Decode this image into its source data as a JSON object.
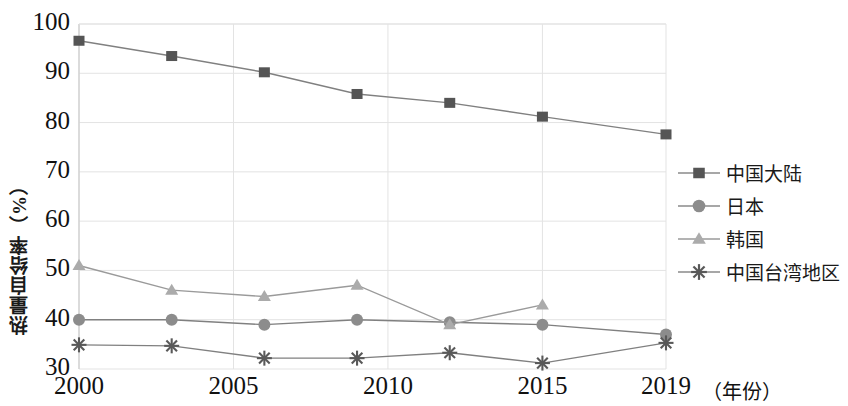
{
  "chart_data": {
    "type": "line",
    "title": "",
    "xlabel": "（年份）",
    "ylabel": "热量自给率（%）",
    "x": [
      2000,
      2003,
      2006,
      2009,
      2012,
      2015,
      2019
    ],
    "xticks": [
      "2000",
      "2005",
      "2010",
      "2015",
      "2019"
    ],
    "xtick_values": [
      2000,
      2005,
      2010,
      2015,
      2019
    ],
    "yticks": [
      "30",
      "40",
      "50",
      "60",
      "70",
      "80",
      "90",
      "100"
    ],
    "ylim": [
      30,
      100
    ],
    "xlim": [
      2000,
      2019
    ],
    "grid": true,
    "legend_position": "right",
    "series": [
      {
        "name": "中国大陆",
        "marker": "square",
        "color": "#555555",
        "values": [
          96.6,
          93.5,
          90.2,
          85.8,
          84.0,
          81.2,
          77.6
        ]
      },
      {
        "name": "日本",
        "marker": "circle",
        "color": "#8c8c8c",
        "values": [
          40.0,
          40.0,
          39.0,
          40.0,
          39.5,
          39.0,
          37.0
        ]
      },
      {
        "name": "韩国",
        "marker": "triangle",
        "color": "#ababab",
        "values": [
          51.0,
          46.0,
          44.7,
          47.0,
          39.0,
          43.0,
          null
        ]
      },
      {
        "name": "中国台湾地区",
        "marker": "asterisk",
        "color": "#595959",
        "values": [
          34.9,
          34.7,
          32.2,
          32.2,
          33.3,
          31.2,
          35.3
        ]
      }
    ]
  },
  "legend": {
    "items": [
      {
        "label": "中国大陆",
        "marker": "square",
        "color": "#555555"
      },
      {
        "label": "日本",
        "marker": "circle",
        "color": "#8c8c8c"
      },
      {
        "label": "韩国",
        "marker": "triangle",
        "color": "#ababab"
      },
      {
        "label": "中国台湾地区",
        "marker": "asterisk",
        "color": "#595959"
      }
    ]
  },
  "axes": {
    "y_label": "热量自给率（%）",
    "x_unit_label": "（年份）",
    "y_ticks": [
      "100",
      "90",
      "80",
      "70",
      "60",
      "50",
      "40",
      "30"
    ],
    "x_ticks": [
      "2000",
      "2005",
      "2010",
      "2015",
      "2019"
    ]
  },
  "style": {
    "grid_color": "#e3e3e3",
    "axis_color": "#cfcfcf",
    "text_color": "#111111",
    "background": "#ffffff"
  }
}
